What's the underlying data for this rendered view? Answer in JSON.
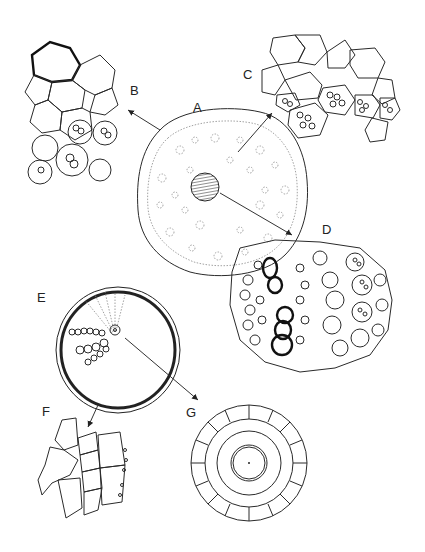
{
  "figure": {
    "panels": [
      {
        "id": "A",
        "label": "A",
        "content": "whole transverse section with central hatched stele"
      },
      {
        "id": "B",
        "label": "B",
        "content": "epidermis and cortex detail (thick-walled outer cells)"
      },
      {
        "id": "C",
        "label": "C",
        "content": "cortex cells with starch grains"
      },
      {
        "id": "D",
        "label": "D",
        "content": "stele detail with thick-walled xylem vessels"
      },
      {
        "id": "E",
        "label": "E",
        "content": "root transverse section with double outer wall"
      },
      {
        "id": "F",
        "label": "F",
        "content": "outer wall / epidermal cell detail"
      },
      {
        "id": "G",
        "label": "G",
        "content": "central stele detail with large central vessel"
      }
    ]
  },
  "colors": {
    "ink": "#222222",
    "background": "#ffffff",
    "faint": "#8a8a8a"
  }
}
